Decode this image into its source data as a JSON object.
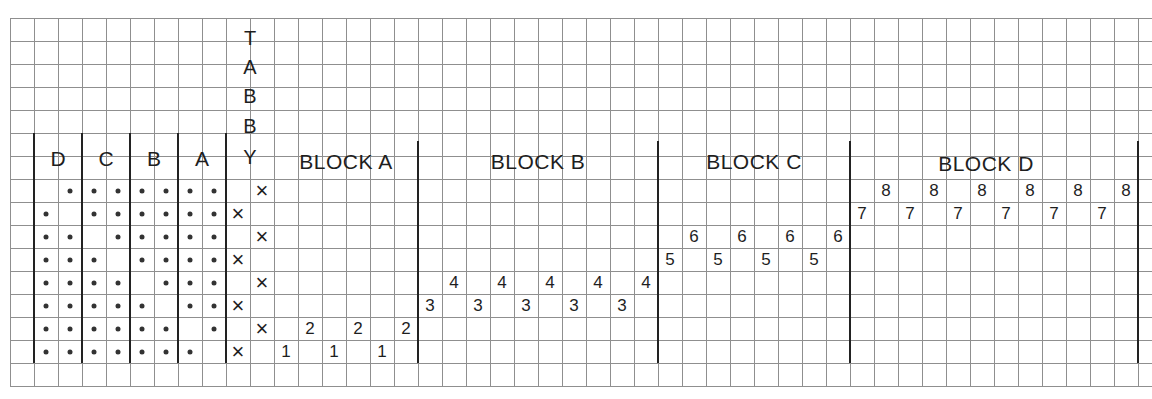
{
  "diagram": {
    "type": "weaving-draft",
    "grid": {
      "origin_x": 10,
      "origin_y": 18,
      "cell_w": 24,
      "cell_h": 23,
      "cols": 48,
      "rows": 16
    },
    "vertical_label": [
      "T",
      "A",
      "B",
      "B",
      "Y"
    ],
    "tieup": {
      "headers": [
        "D",
        "C",
        "B",
        "A"
      ],
      "rows": [
        [
          0,
          1,
          1,
          1,
          1,
          1,
          1,
          1
        ],
        [
          1,
          0,
          1,
          1,
          1,
          1,
          1,
          1
        ],
        [
          1,
          1,
          0,
          1,
          1,
          1,
          1,
          1
        ],
        [
          1,
          1,
          1,
          0,
          1,
          1,
          1,
          1
        ],
        [
          1,
          1,
          1,
          1,
          0,
          1,
          1,
          1
        ],
        [
          1,
          1,
          1,
          1,
          1,
          0,
          1,
          1
        ],
        [
          1,
          1,
          1,
          1,
          1,
          1,
          0,
          1
        ],
        [
          1,
          1,
          1,
          1,
          1,
          1,
          1,
          0
        ]
      ],
      "tabby_x_cols": [
        "right",
        "left",
        "right",
        "left",
        "right",
        "left",
        "right",
        "left"
      ],
      "tabby_mark": "×"
    },
    "blocks": [
      {
        "title": "BLOCK A",
        "start_col": 11,
        "width": 6,
        "low_row": 14,
        "high_row": 13,
        "low": "1",
        "high": "2"
      },
      {
        "title": "BLOCK B",
        "start_col": 17,
        "width": 10,
        "low_row": 12,
        "high_row": 11,
        "low": "3",
        "high": "4"
      },
      {
        "title": "BLOCK C",
        "start_col": 27,
        "width": 8,
        "low_row": 10,
        "high_row": 9,
        "low": "5",
        "high": "6"
      },
      {
        "title": "BLOCK D",
        "start_col": 35,
        "width": 12,
        "low_row": 8,
        "high_row": 7,
        "low": "7",
        "high": "8"
      }
    ],
    "colors": {
      "grid": "#8f8f8f",
      "bold": "#222222",
      "ink": "#1e1e1e",
      "paper": "#ffffff"
    }
  }
}
